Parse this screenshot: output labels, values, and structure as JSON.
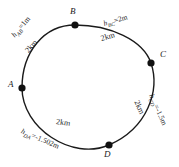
{
  "figure": {
    "stroke_color": "#1a1a1a",
    "background_color": "#ffffff"
  },
  "stations": [
    {
      "id": "A",
      "label": "A",
      "x": 22,
      "y": 88,
      "label_x": 8,
      "label_y": 83
    },
    {
      "id": "B",
      "label": "B",
      "x": 75,
      "y": 25,
      "label_x": 70,
      "label_y": 9
    },
    {
      "id": "C",
      "label": "C",
      "x": 151,
      "y": 63,
      "label_x": 160,
      "label_y": 52
    },
    {
      "id": "D",
      "label": "D",
      "x": 109,
      "y": 145,
      "label_x": 104,
      "label_y": 150
    }
  ],
  "legs": [
    {
      "id": "AB",
      "height_text": "h",
      "height_sub": "AB",
      "height_value": "=1m",
      "height_full": "h_AB=1m",
      "distance": "2km",
      "h_x": 17,
      "h_y": 30,
      "h_rot": -50,
      "d_x": 30,
      "d_y": 45,
      "d_rot": -50
    },
    {
      "id": "BC",
      "height_text": "h",
      "height_sub": "BC",
      "height_value": "=2m",
      "height_full": "h_BC=2m",
      "distance": "2km",
      "h_x": 106,
      "h_y": 20,
      "h_rot": -16,
      "d_x": 104,
      "d_y": 35,
      "d_rot": -16
    },
    {
      "id": "CD",
      "height_text": "h",
      "height_sub": "CD",
      "height_value": "=-1.5m",
      "height_full": "h_CD=-1.5m",
      "distance": "2km",
      "h_x": 150,
      "h_y": 92,
      "h_rot": 66,
      "d_x": 135,
      "d_y": 98,
      "d_rot": 66
    },
    {
      "id": "DA",
      "height_text": "h",
      "height_sub": "DA",
      "height_value": "=-1.502m",
      "height_full": "h_DA=-1.502m",
      "distance": "2km",
      "h_x": 22,
      "h_y": 126,
      "h_rot": 23,
      "d_x": 57,
      "d_y": 119,
      "d_rot": 10
    }
  ]
}
